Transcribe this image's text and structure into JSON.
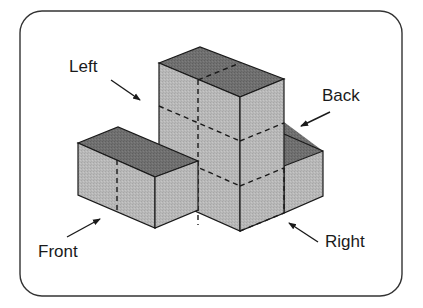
{
  "figure": {
    "type": "isometric-block-diagram",
    "frame": {
      "style": "rounded-rectangle"
    },
    "labels": {
      "left": "Left",
      "back": "Back",
      "front": "Front",
      "right": "Right"
    },
    "colors": {
      "top_face": "#6e6e6e",
      "side_face": "#b9b9b9",
      "edge": "#1a1a1a",
      "frame": "#333333"
    }
  }
}
